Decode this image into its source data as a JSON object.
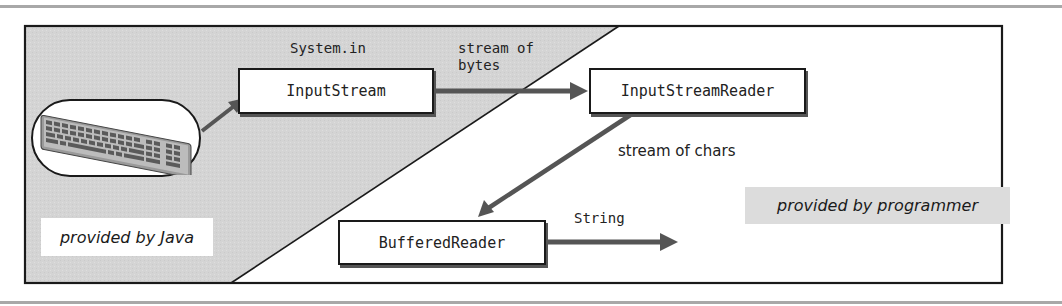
{
  "diagram": {
    "type": "data-flow",
    "regions": {
      "java": {
        "label": "provided by Java",
        "fill": "#d4d4d4"
      },
      "programmer": {
        "label": "provided by programmer",
        "fill": "#ffffff",
        "label_fill": "#dcdcdc"
      }
    },
    "source": {
      "name": "keyboard",
      "icon": "keyboard-icon"
    },
    "nodes": [
      {
        "id": "input_stream",
        "label": "InputStream",
        "caption": "System.in"
      },
      {
        "id": "input_stream_reader",
        "label": "InputStreamReader"
      },
      {
        "id": "buffered_reader",
        "label": "BufferedReader"
      }
    ],
    "edges": [
      {
        "from": "keyboard",
        "to": "input_stream",
        "label": ""
      },
      {
        "from": "input_stream",
        "to": "input_stream_reader",
        "label": "stream of\nbytes"
      },
      {
        "from": "input_stream_reader",
        "to": "buffered_reader",
        "label": "stream of chars"
      },
      {
        "from": "buffered_reader",
        "to": "output",
        "label": "String"
      }
    ],
    "colors": {
      "frame": "#1a1a1a",
      "arrow": "#555555",
      "gray_region": "#d4d4d4",
      "rule": "#a8a8a8"
    }
  }
}
